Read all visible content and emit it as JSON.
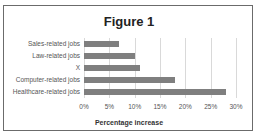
{
  "chart_data": {
    "type": "bar",
    "orientation": "horizontal",
    "title": "Figure 1",
    "xlabel": "Percentage increase",
    "ylabel": "",
    "categories": [
      "Sales-related jobs",
      "Law-related jobs",
      "X",
      "Computer-related jobs",
      "Healthcare-related jobs"
    ],
    "values": [
      7,
      10,
      11,
      18,
      28
    ],
    "unit": "%",
    "xlim": [
      0,
      30
    ],
    "x_ticks": [
      "0%",
      "5%",
      "10%",
      "15%",
      "20%",
      "25%",
      "30%"
    ],
    "grid": "vertical",
    "legend": "none",
    "bar_color": "#7f7f7f"
  }
}
